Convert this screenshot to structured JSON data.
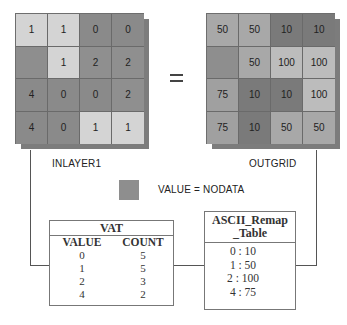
{
  "operator": "=",
  "colors": {
    "nodata": "#8e8e8e",
    "input": {
      "0": "#8a8a8a",
      "1": "#d4d4d4",
      "2": "#8f8f8f",
      "4": "#8a8a8a"
    },
    "output": {
      "10": "#7a7a7a",
      "50": "#a8a8a8",
      "75": "#a0a0a0",
      "100": "#bcbcbc"
    }
  },
  "inlayer": {
    "label": "INLAYER1",
    "cells": [
      [
        "1",
        "1",
        "0",
        "0"
      ],
      [
        "",
        "1",
        "2",
        "2"
      ],
      [
        "4",
        "0",
        "0",
        "2"
      ],
      [
        "4",
        "0",
        "1",
        "1"
      ]
    ]
  },
  "outgrid": {
    "label": "OUTGRID",
    "cells": [
      [
        "50",
        "50",
        "10",
        "10"
      ],
      [
        "",
        "50",
        "100",
        "100"
      ],
      [
        "75",
        "10",
        "10",
        "100"
      ],
      [
        "75",
        "10",
        "50",
        "50"
      ]
    ]
  },
  "legend": {
    "label": "VALUE = NODATA"
  },
  "vat": {
    "title": "VAT",
    "columns": [
      "VALUE",
      "COUNT"
    ],
    "rows": [
      {
        "value": "0",
        "count": "5"
      },
      {
        "value": "1",
        "count": "5"
      },
      {
        "value": "2",
        "count": "3"
      },
      {
        "value": "4",
        "count": "2"
      }
    ]
  },
  "remap": {
    "title_line1": "ASCII_Remap",
    "title_line2": "_Table",
    "rows": [
      "0 : 10",
      "1 : 50",
      "2 : 100",
      "4 : 75"
    ]
  }
}
